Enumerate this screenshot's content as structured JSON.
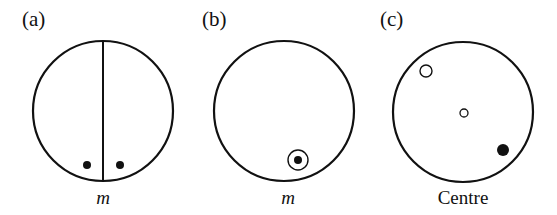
{
  "panels": [
    {
      "id": "a",
      "label": "(a)",
      "caption": "m",
      "caption_italic": true,
      "circle": {
        "cx": 103,
        "cy": 111,
        "r": 70
      },
      "mirror_line": {
        "x": 103,
        "y1": 41,
        "y2": 181
      },
      "points": [
        {
          "type": "filled",
          "cx": 87,
          "cy": 165,
          "r": 4
        },
        {
          "type": "filled",
          "cx": 120,
          "cy": 165,
          "r": 4
        }
      ]
    },
    {
      "id": "b",
      "label": "(b)",
      "caption": "m",
      "caption_italic": true,
      "circle": {
        "cx": 284,
        "cy": 111,
        "r": 70
      },
      "points": [
        {
          "type": "ringed-filled",
          "cx": 298,
          "cy": 160,
          "r_outer": 10,
          "r": 4
        }
      ]
    },
    {
      "id": "c",
      "label": "(c)",
      "caption": "Centre",
      "caption_italic": false,
      "circle": {
        "cx": 463,
        "cy": 112,
        "r": 70
      },
      "points": [
        {
          "type": "open",
          "cx": 426,
          "cy": 71,
          "r": 6
        },
        {
          "type": "open-centre",
          "cx": 464,
          "cy": 113,
          "r": 4
        },
        {
          "type": "filled",
          "cx": 503,
          "cy": 150,
          "r": 6
        }
      ]
    }
  ],
  "colors": {
    "stroke": "#111111",
    "background": "#ffffff"
  }
}
